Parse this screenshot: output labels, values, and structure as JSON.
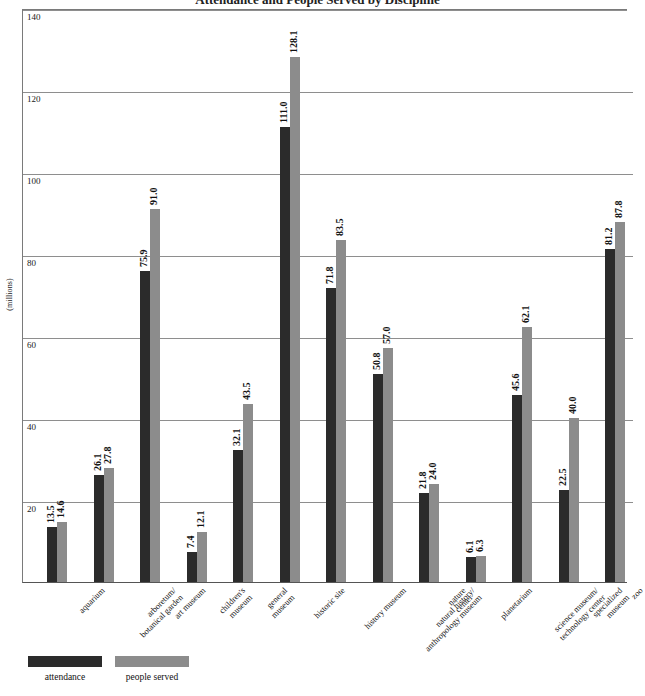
{
  "figure": {
    "title_cropped": "Attendance and People Served by Discipline",
    "y_axis_caption": "(millions)"
  },
  "legend": {
    "position": "bottom-left",
    "entries": [
      {
        "label": "attendance",
        "color": "#2b2b2b"
      },
      {
        "label": "people served",
        "color": "#8c8c8c"
      }
    ]
  },
  "chart_data": {
    "type": "bar",
    "title": "Attendance and People Served by Discipline",
    "xlabel": "",
    "ylabel": "(millions)",
    "ylim": [
      0,
      140
    ],
    "yticks": [
      20,
      40,
      60,
      80,
      100,
      120,
      140
    ],
    "grid": true,
    "grouped": true,
    "legend_position": "bottom-left",
    "categories": [
      "aquarium",
      "arboretum/ botanical garden",
      "art museum",
      "children's museum",
      "general museum",
      "historic site",
      "history museum",
      "natural history/ anthropology museum",
      "nature center",
      "planetarium",
      "science museum/ technology center",
      "specialized museum",
      "zoo"
    ],
    "category_lines": [
      [
        "aquarium"
      ],
      [
        "arboretum/",
        "botanical garden"
      ],
      [
        "art museum"
      ],
      [
        "children's",
        "museum"
      ],
      [
        "general",
        "museum"
      ],
      [
        "historic site"
      ],
      [
        "history museum"
      ],
      [
        "natural history/",
        "anthropology museum"
      ],
      [
        "nature",
        "center"
      ],
      [
        "planetarium"
      ],
      [
        "science museum/",
        "technology center"
      ],
      [
        "specialized",
        "museum"
      ],
      [
        "zoo"
      ]
    ],
    "series": [
      {
        "name": "attendance",
        "color": "#2b2b2b",
        "values": [
          13.5,
          26.1,
          75.9,
          7.4,
          32.1,
          111.0,
          71.8,
          50.8,
          21.8,
          6.1,
          45.6,
          22.5,
          81.2
        ],
        "labels": [
          "13.5",
          "26.1",
          "75.9",
          "7.4",
          "32.1",
          "111.0",
          "71.8",
          "50.8",
          "21.8",
          "6.1",
          "45.6",
          "22.5",
          "81.2"
        ]
      },
      {
        "name": "people served",
        "color": "#8c8c8c",
        "values": [
          14.6,
          27.8,
          91.0,
          12.1,
          43.5,
          128.1,
          83.5,
          57.0,
          24.0,
          6.3,
          62.1,
          40.0,
          87.8
        ],
        "labels": [
          "14.6",
          "27.8",
          "91.0",
          "12.1",
          "43.5",
          "128.1",
          "83.5",
          "57.0",
          "24.0",
          "6.3",
          "62.1",
          "40.0",
          "87.8"
        ]
      }
    ]
  }
}
